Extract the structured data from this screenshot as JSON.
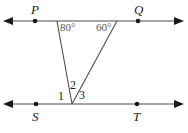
{
  "figure": {
    "type": "geometry-diagram",
    "width": 188,
    "height": 133,
    "background_color": "#ffffff",
    "line_color": "#4d4d4d",
    "label_color": "#1a1a1a",
    "angle_label_color": "#555555"
  },
  "lines": {
    "top": {
      "name": "line-PQ",
      "y": 21,
      "x_start": 5,
      "x_end": 181,
      "arrow_left": true,
      "arrow_right": true
    },
    "bottom": {
      "name": "line-ST",
      "y": 104,
      "x_start": 5,
      "x_end": 181,
      "arrow_left": true,
      "arrow_right": true
    }
  },
  "transversals": [
    {
      "name": "transversal-left",
      "x1": 57,
      "y1": 21,
      "x2": 72,
      "y2": 104
    },
    {
      "name": "transversal-right",
      "x1": 117,
      "y1": 21,
      "x2": 72,
      "y2": 104
    }
  ],
  "points": [
    {
      "id": "P",
      "label": "P",
      "x": 35,
      "y": 21,
      "label_position": "above"
    },
    {
      "id": "Q",
      "label": "Q",
      "x": 138,
      "y": 21,
      "label_position": "above"
    },
    {
      "id": "S",
      "label": "S",
      "x": 36,
      "y": 104,
      "label_position": "below"
    },
    {
      "id": "T",
      "label": "T",
      "x": 137,
      "y": 104,
      "label_position": "below"
    }
  ],
  "vertex": {
    "name": "triangle-apex",
    "x": 72,
    "y": 104
  },
  "angles": {
    "top_left": {
      "label": "80°",
      "value": 80,
      "unit": "degrees",
      "at_point_x": 57,
      "at_point_y": 21
    },
    "top_right": {
      "label": "60°",
      "value": 60,
      "unit": "degrees",
      "at_point_x": 117,
      "at_point_y": 21
    },
    "numbered": [
      {
        "label": "1",
        "position": "left-of-apex-on-bottom-line"
      },
      {
        "label": "2",
        "position": "interior-above-apex"
      },
      {
        "label": "3",
        "position": "right-of-apex-on-bottom-line"
      }
    ]
  }
}
